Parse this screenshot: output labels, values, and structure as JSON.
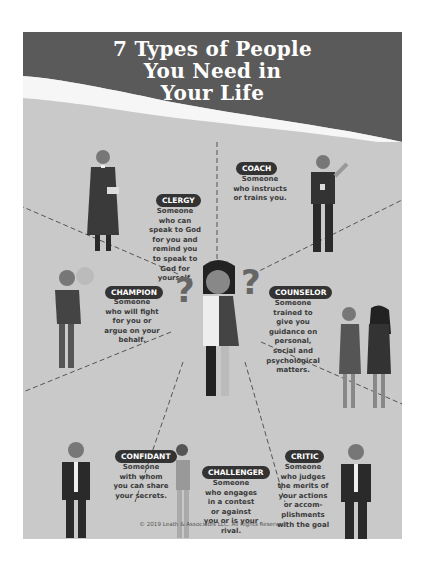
{
  "title": {
    "line1": "7 Types of People",
    "line2": "You Need in",
    "line3": "Your Life"
  },
  "colors": {
    "banner": "#5a5a5a",
    "background": "#c9c9c9",
    "pill": "#333333",
    "text": "#3a3a3a"
  },
  "types": [
    {
      "label": "CLERGY",
      "description": [
        "Someone",
        "who can",
        "speak to God",
        "for you and",
        "remind you",
        "to speak to",
        "God for",
        "yourself."
      ]
    },
    {
      "label": "COACH",
      "description": [
        "Someone",
        "who instructs",
        "or trains you."
      ]
    },
    {
      "label": "CHAMPION",
      "description": [
        "Someone",
        "who will fight",
        "for you or",
        "argue on your",
        "behalf."
      ]
    },
    {
      "label": "COUNSELOR",
      "description": [
        "Someone",
        "trained to",
        "give you",
        "guidance on",
        "personal,",
        "social and",
        "psychological",
        "matters."
      ]
    },
    {
      "label": "CONFIDANT",
      "description": [
        "Someone",
        "with whom",
        "you can share",
        "your secrets."
      ]
    },
    {
      "label": "CHALLENGER",
      "description": [
        "Someone",
        "who engages",
        "in a contest",
        "or against",
        "you or is your",
        "rival."
      ]
    },
    {
      "label": "CRITIC",
      "description": [
        "Someone",
        "who judges",
        "the merits of",
        "your actions",
        "or accom-",
        "plishments",
        "with the goal"
      ]
    }
  ],
  "center_icons": {
    "left": "question-mark-icon",
    "right": "question-mark-icon"
  },
  "footer": {
    "copyright": "© 2019 Leath & Associates LLC. All Rights Reserved"
  }
}
